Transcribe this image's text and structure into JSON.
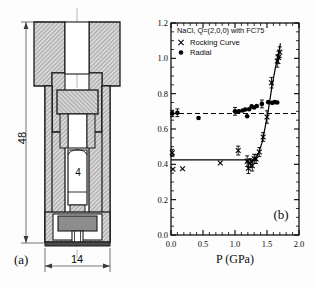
{
  "figure": {
    "panel_a": {
      "label": "(a)",
      "caption": "cross-section of high pressure cell",
      "dimensions": [
        {
          "name": "overall-height",
          "value": "48",
          "orientation": "vertical"
        },
        {
          "name": "sample-length",
          "value": "4",
          "orientation": "vertical"
        },
        {
          "name": "outer-diameter",
          "value": "14",
          "orientation": "horizontal"
        }
      ]
    },
    "panel_b": {
      "label": "(b)"
    }
  },
  "chart_data": {
    "type": "scatter",
    "title": "",
    "annotation": "NaCl, Q=(2,0,0) with FC75",
    "xlabel": "P (GPa)",
    "ylabel": "FWHM (degree)",
    "xlim": [
      0.0,
      2.0
    ],
    "ylim": [
      0.0,
      1.2
    ],
    "xticks": [
      "0.0",
      "0.5",
      "1.0",
      "1.5",
      "2.0"
    ],
    "xtick_values": [
      0.0,
      0.5,
      1.0,
      1.5,
      2.0
    ],
    "yticks": [
      "0.0",
      "0.2",
      "0.4",
      "0.6",
      "0.8",
      "1.0",
      "1.2"
    ],
    "ytick_values": [
      0.0,
      0.2,
      0.4,
      0.6,
      0.8,
      1.0,
      1.2
    ],
    "xminor_step": 0.1,
    "yminor_step": 0.05,
    "grid": false,
    "legend_position": "top-left",
    "legend": [
      {
        "marker": "x",
        "name": "Rocking Curve"
      },
      {
        "marker": "circle",
        "name": "Radial"
      }
    ],
    "series": [
      {
        "name": "Rocking Curve",
        "marker": "x",
        "points": [
          {
            "x": 0.02,
            "y": 0.465,
            "yerr": 0.02
          },
          {
            "x": 0.03,
            "y": 0.372,
            "yerr": 0.0
          },
          {
            "x": 0.18,
            "y": 0.375,
            "yerr": 0.0
          },
          {
            "x": 0.77,
            "y": 0.408,
            "yerr": 0.0
          },
          {
            "x": 1.05,
            "y": 0.478,
            "yerr": 0.025
          },
          {
            "x": 1.19,
            "y": 0.418,
            "yerr": 0.03
          },
          {
            "x": 1.21,
            "y": 0.378,
            "yerr": 0.03
          },
          {
            "x": 1.24,
            "y": 0.407,
            "yerr": 0.025
          },
          {
            "x": 1.27,
            "y": 0.392,
            "yerr": 0.03
          },
          {
            "x": 1.3,
            "y": 0.432,
            "yerr": 0.025
          },
          {
            "x": 1.33,
            "y": 0.43,
            "yerr": 0.025
          },
          {
            "x": 1.38,
            "y": 0.47,
            "yerr": 0.025
          },
          {
            "x": 1.44,
            "y": 0.555,
            "yerr": 0.025
          },
          {
            "x": 1.5,
            "y": 0.668,
            "yerr": 0.035
          },
          {
            "x": 1.57,
            "y": 0.862,
            "yerr": 0.03
          },
          {
            "x": 1.66,
            "y": 0.985,
            "yerr": 0.035
          },
          {
            "x": 1.68,
            "y": 1.005,
            "yerr": 0.035
          },
          {
            "x": 1.7,
            "y": 1.035,
            "yerr": 0.03
          }
        ]
      },
      {
        "name": "Radial",
        "marker": "circle",
        "points": [
          {
            "x": 0.02,
            "y": 0.688,
            "yerr": 0.018
          },
          {
            "x": 0.1,
            "y": 0.692,
            "yerr": 0.022
          },
          {
            "x": 0.43,
            "y": 0.662,
            "yerr": 0.0
          },
          {
            "x": 1.0,
            "y": 0.7,
            "yerr": 0.022
          },
          {
            "x": 1.06,
            "y": 0.7,
            "yerr": 0.0
          },
          {
            "x": 1.12,
            "y": 0.705,
            "yerr": 0.0
          },
          {
            "x": 1.16,
            "y": 0.71,
            "yerr": 0.0
          },
          {
            "x": 1.19,
            "y": 0.672,
            "yerr": 0.0
          },
          {
            "x": 1.22,
            "y": 0.712,
            "yerr": 0.0
          },
          {
            "x": 1.26,
            "y": 0.728,
            "yerr": 0.0
          },
          {
            "x": 1.3,
            "y": 0.722,
            "yerr": 0.0
          },
          {
            "x": 1.34,
            "y": 0.73,
            "yerr": 0.0
          },
          {
            "x": 1.42,
            "y": 0.742,
            "yerr": 0.022
          },
          {
            "x": 1.52,
            "y": 0.752,
            "yerr": 0.0
          },
          {
            "x": 1.58,
            "y": 0.748,
            "yerr": 0.0
          },
          {
            "x": 1.62,
            "y": 0.752,
            "yerr": 0.0
          },
          {
            "x": 1.66,
            "y": 0.75,
            "yerr": 0.0
          }
        ]
      }
    ],
    "reference_lines": [
      {
        "name": "radial-baseline",
        "style": "dashed",
        "y": 0.688,
        "x_start": 0.0,
        "x_end": 2.0
      },
      {
        "name": "rocking-baseline",
        "style": "solid",
        "y": 0.425,
        "x_start": 0.0,
        "x_end": 1.33
      }
    ],
    "fit_curve": {
      "name": "rocking-curve-fit",
      "style": "solid",
      "points": [
        {
          "x": 1.22,
          "y": 0.405
        },
        {
          "x": 1.3,
          "y": 0.425
        },
        {
          "x": 1.36,
          "y": 0.455
        },
        {
          "x": 1.42,
          "y": 0.52
        },
        {
          "x": 1.47,
          "y": 0.608
        },
        {
          "x": 1.52,
          "y": 0.705
        },
        {
          "x": 1.58,
          "y": 0.845
        },
        {
          "x": 1.63,
          "y": 0.945
        },
        {
          "x": 1.69,
          "y": 1.045
        },
        {
          "x": 1.71,
          "y": 1.085
        }
      ]
    }
  }
}
